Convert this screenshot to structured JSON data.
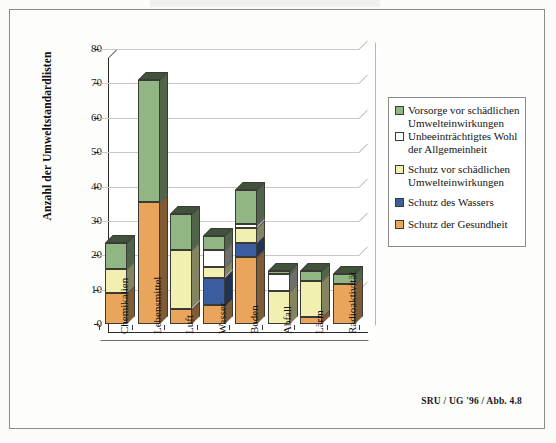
{
  "chart_data": {
    "type": "bar",
    "subtype": "stacked-3d-column",
    "title": "",
    "xlabel": "",
    "ylabel": "Anzahl der Umweltstandardlisten",
    "ylim": [
      0,
      80
    ],
    "yticks": [
      0,
      10,
      20,
      30,
      40,
      50,
      60,
      70,
      80
    ],
    "grid": true,
    "legend_position": "right",
    "categories": [
      "Chemikalien",
      "Lebensmittel",
      "Luft",
      "Wasser",
      "Boden",
      "Abfall",
      "Lärm",
      "Radioaktivität"
    ],
    "series": [
      {
        "name": "Schutz der Gesundheit",
        "color": "#e9a55c",
        "values": [
          9,
          35.5,
          4.5,
          5.5,
          19.5,
          0,
          2,
          11.5
        ]
      },
      {
        "name": "Schutz des Wassers",
        "color": "#3c5e9e",
        "values": [
          0,
          0,
          0,
          8,
          4,
          0,
          0,
          0
        ]
      },
      {
        "name": "Schutz vor schädlichen Umwelteinwirkungen",
        "color": "#f2f0b0",
        "values": [
          7,
          0,
          17,
          3,
          4.5,
          9.5,
          10.5,
          0
        ]
      },
      {
        "name": "Unbeeinträchtigtes Wohl der Allgemeinheit",
        "color": "#ffffff",
        "values": [
          0,
          0,
          0,
          5,
          1,
          5,
          0,
          0
        ]
      },
      {
        "name": "Vorsorge vor schädlichen Umwelteinwirkungen",
        "color": "#91b684",
        "values": [
          7.5,
          35.5,
          10.5,
          4,
          10,
          1,
          3,
          3
        ]
      }
    ],
    "totals": [
      23.5,
      71,
      32,
      25.5,
      39,
      15.5,
      15.5,
      14.5
    ]
  },
  "legend": {
    "items": [
      {
        "label": "Vorsorge vor schädlichen Umwelteinwirkungen",
        "color": "#91b684",
        "name": "vorsorge"
      },
      {
        "label": "Unbeeinträchtigtes Wohl der Allgemeinheit",
        "color": "#ffffff",
        "name": "wohl-allgemeinheit"
      },
      {
        "label": "Schutz vor schädlichen Umwelteinwirkungen",
        "color": "#f2f0b0",
        "name": "schutz-umwelteinwirkungen"
      },
      {
        "label": "Schutz des Wassers",
        "color": "#3c5e9e",
        "name": "schutz-wassers"
      },
      {
        "label": "Schutz der Gesundheit",
        "color": "#e9a55c",
        "name": "schutz-gesundheit"
      }
    ]
  },
  "axis": {
    "y_title": "Anzahl der Umweltstandardlisten",
    "y_tick_labels": [
      "80",
      "70",
      "60",
      "50",
      "40",
      "30",
      "20",
      "10",
      "0"
    ]
  },
  "footer": {
    "source": "SRU / UG '96 / Abb. 4.8"
  },
  "colors": {
    "green": "#91b684",
    "white": "#ffffff",
    "yellow": "#f2f0b0",
    "blue": "#3c5e9e",
    "orange": "#e9a55c",
    "outline": "#3a3a36",
    "grid": "#c9c9c4",
    "frame": "#8c8c86"
  }
}
